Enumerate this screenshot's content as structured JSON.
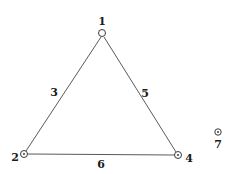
{
  "diagram": {
    "type": "graph",
    "nodes": [
      {
        "id": "1",
        "label": "1",
        "marker": "open-circle"
      },
      {
        "id": "2",
        "label": "2",
        "marker": "dotted-circle"
      },
      {
        "id": "4",
        "label": "4",
        "marker": "dotted-circle"
      },
      {
        "id": "7",
        "label": "7",
        "marker": "dotted-circle"
      }
    ],
    "edges": [
      {
        "id": "3",
        "label": "3",
        "from": "1",
        "to": "2"
      },
      {
        "id": "5",
        "label": "5",
        "from": "1",
        "to": "4"
      },
      {
        "id": "6",
        "label": "6",
        "from": "2",
        "to": "4"
      }
    ]
  }
}
